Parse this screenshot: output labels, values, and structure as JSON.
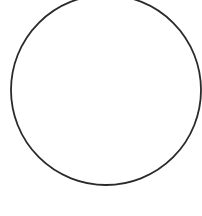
{
  "shape": {
    "type": "circle",
    "cx": 106,
    "cy": 90,
    "r": 95,
    "stroke": "#2a2a2a",
    "stroke_width": 1.8,
    "fill": "none"
  },
  "background": "#ffffff"
}
